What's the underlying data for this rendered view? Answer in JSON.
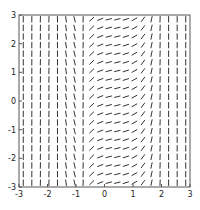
{
  "chart_data": {
    "type": "quiver",
    "title": "",
    "xlabel": "",
    "ylabel": "",
    "xlim": [
      -3,
      3
    ],
    "ylim": [
      -3,
      3
    ],
    "grid": false,
    "legend": null,
    "x_ticks": [
      -3,
      -2,
      -1,
      0,
      1,
      2,
      3
    ],
    "y_ticks": [
      -3,
      -2,
      -1,
      0,
      1,
      2,
      3
    ],
    "x_tick_labels": [
      "-3",
      "-2",
      "-1",
      "0",
      "1",
      "2",
      "3"
    ],
    "y_tick_labels": [
      "-3",
      "-2",
      "-1",
      "0",
      "1",
      "2",
      "3"
    ],
    "grid_points": 20,
    "arrow_color": "#333333"
  },
  "plot": {
    "axes_box": {
      "left": 19,
      "top": 15,
      "right": 190,
      "bottom": 187
    }
  }
}
